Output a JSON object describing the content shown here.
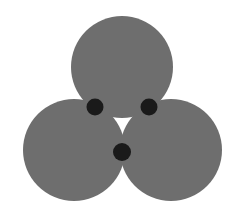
{
  "canvas": {
    "width": 242,
    "height": 216,
    "background_color": "#ffffff"
  },
  "figure": {
    "shape_type": "geometric-illustration",
    "circle_fill_color": "#6e6e6e",
    "dot_fill_color": "#1a1a1a",
    "gap_color": "#ffffff",
    "circle_count": 3,
    "dot_count": 3
  },
  "circles": [
    {
      "id": "top-circle",
      "label": "top circle",
      "cx": 122,
      "cy": 67,
      "r": 51,
      "fill": "#6e6e6e"
    },
    {
      "id": "bottom-left-circle",
      "label": "bottom left circle",
      "cx": 74,
      "cy": 150,
      "r": 51,
      "fill": "#6e6e6e"
    },
    {
      "id": "bottom-right-circle",
      "label": "bottom right circle",
      "cx": 171,
      "cy": 150,
      "r": 51,
      "fill": "#6e6e6e"
    }
  ],
  "dots": [
    {
      "id": "dot-upper-left",
      "label": "upper left tangency dot",
      "cx": 95,
      "cy": 107,
      "r": 8.5,
      "fill": "#1a1a1a"
    },
    {
      "id": "dot-upper-right",
      "label": "upper right tangency dot",
      "cx": 149,
      "cy": 107,
      "r": 8.5,
      "fill": "#1a1a1a"
    },
    {
      "id": "dot-bottom",
      "label": "bottom tangency dot",
      "cx": 122,
      "cy": 152,
      "r": 9.0,
      "fill": "#1a1a1a"
    }
  ]
}
